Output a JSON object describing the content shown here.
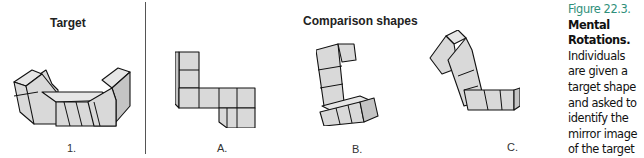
{
  "panels": {
    "target": {
      "heading": "Target",
      "label": "1."
    },
    "comparison": {
      "heading": "Comparison shapes",
      "labels": [
        "A.",
        "B.",
        "C."
      ]
    }
  },
  "caption": {
    "figure_number": "Figure 22.3.",
    "title": "Mental Rotations.",
    "body": "Individuals are given a target shape and asked to identify the mirror image of the target shape from a set of comparison shapes, as shown."
  },
  "colors": {
    "figure_number": "#2f8f7a",
    "cube_face": "#e0e0e0",
    "outline": "#111111"
  }
}
